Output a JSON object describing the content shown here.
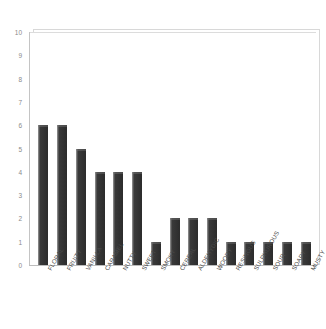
{
  "chart_data": {
    "type": "bar",
    "title": "",
    "subtitle": "",
    "xlabel": "",
    "ylabel": "",
    "categories": [
      "FLORAL",
      "FRUITY",
      "VANILLA",
      "CARAMEL",
      "NUTTY",
      "SWEET",
      "SMOKY",
      "CEREAL",
      "ALDEHYDIC",
      "WOODY",
      "RESINOUS",
      "SULPHUROUS",
      "SOUR",
      "SOAPY",
      "MUSTY"
    ],
    "values": [
      6,
      6,
      5,
      4,
      4,
      4,
      1,
      2,
      2,
      2,
      1,
      1,
      1,
      1,
      1
    ],
    "ylim": [
      0,
      10
    ],
    "ytick_labels": [
      "0",
      "1",
      "2",
      "3",
      "4",
      "5",
      "6",
      "7",
      "8",
      "9",
      "10"
    ],
    "ytick_values": [
      0,
      1,
      2,
      3,
      4,
      5,
      6,
      7,
      8,
      9,
      10
    ],
    "grid": false,
    "legend": false,
    "legend_position": "none",
    "bar_color": "#3a3a3a",
    "bar_highlight_color": "#9a9a9a",
    "axis_color": "#c4c4c4",
    "tick_label_color": "#8a8a8a",
    "category_label_color": "#4a4a4a",
    "label_rotation_degrees": -60,
    "background_color": "#ffffff"
  }
}
